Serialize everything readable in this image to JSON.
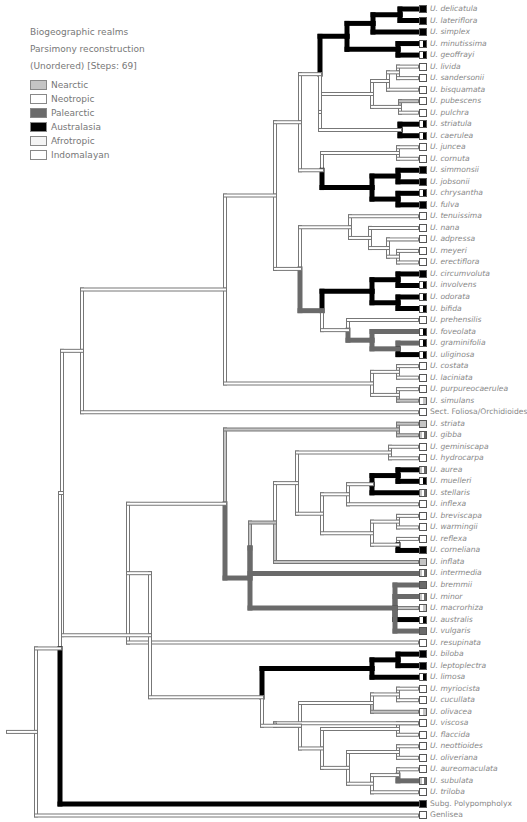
{
  "header": {
    "line1": "Biogeographic realms",
    "line2": "Parsimony reconstruction",
    "line3": "(Unordered) [Steps: 69]"
  },
  "legend": [
    {
      "label": "Nearctic",
      "color": "#c4c4c4"
    },
    {
      "label": "Neotropic",
      "color": "#ffffff"
    },
    {
      "label": "Palearctic",
      "color": "#6a6a6a"
    },
    {
      "label": "Australasia",
      "color": "#000000"
    },
    {
      "label": "Afrotropic",
      "color": "#f4f4f4"
    },
    {
      "label": "Indomalayan",
      "color": "#ffffff"
    }
  ],
  "colors": {
    "nearctic": "#c4c4c4",
    "neotropic": "#ffffff",
    "palearctic": "#6a6a6a",
    "australasia": "#000000",
    "outline": "#777777"
  },
  "taxa": [
    {
      "name": "U. delicatula",
      "state": "australasia"
    },
    {
      "name": "U. lateriflora",
      "state": "australasia"
    },
    {
      "name": "U. simplex",
      "state": "australasia"
    },
    {
      "name": "U. minutissima",
      "state": "mixed-aus"
    },
    {
      "name": "U. geoffrayi",
      "state": "mixed-aus"
    },
    {
      "name": "U. livida",
      "state": "neotropic"
    },
    {
      "name": "U. sandersonii",
      "state": "neotropic"
    },
    {
      "name": "U. bisquamata",
      "state": "neotropic"
    },
    {
      "name": "U. pubescens",
      "state": "neotropic"
    },
    {
      "name": "U. pulchra",
      "state": "neotropic"
    },
    {
      "name": "U. striatula",
      "state": "mixed-aus"
    },
    {
      "name": "U. caerulea",
      "state": "mixed-aus"
    },
    {
      "name": "U. juncea",
      "state": "neotropic"
    },
    {
      "name": "U. cornuta",
      "state": "neotropic"
    },
    {
      "name": "U. simmonsii",
      "state": "australasia"
    },
    {
      "name": "U. jobsonii",
      "state": "australasia"
    },
    {
      "name": "U. chrysantha",
      "state": "mixed-aus"
    },
    {
      "name": "U. fulva",
      "state": "australasia"
    },
    {
      "name": "U. tenuissima",
      "state": "neotropic"
    },
    {
      "name": "U. nana",
      "state": "neotropic"
    },
    {
      "name": "U. adpressa",
      "state": "neotropic"
    },
    {
      "name": "U. meyeri",
      "state": "neotropic"
    },
    {
      "name": "U. erectiflora",
      "state": "neotropic"
    },
    {
      "name": "U. circumvoluta",
      "state": "australasia"
    },
    {
      "name": "U. involvens",
      "state": "mixed-aus"
    },
    {
      "name": "U. odorata",
      "state": "mixed-aus"
    },
    {
      "name": "U. bifida",
      "state": "mixed-aus"
    },
    {
      "name": "U. prehensilis",
      "state": "neotropic"
    },
    {
      "name": "U. foveolata",
      "state": "mixed-aus"
    },
    {
      "name": "U. graminifolia",
      "state": "mixed-aus"
    },
    {
      "name": "U. uliginosa",
      "state": "mixed-aus"
    },
    {
      "name": "U. costata",
      "state": "neotropic"
    },
    {
      "name": "U. laciniata",
      "state": "neotropic"
    },
    {
      "name": "U. purpureocaerulea",
      "state": "neotropic"
    },
    {
      "name": "U. simulans",
      "state": "mixed-near"
    },
    {
      "name": "Sect. Foliosa/Orchidioides",
      "state": "neotropic"
    },
    {
      "name": "U. striata",
      "state": "nearctic"
    },
    {
      "name": "U. gibba",
      "state": "mixed-pal"
    },
    {
      "name": "U. geminiscapa",
      "state": "neotropic"
    },
    {
      "name": "U. hydrocarpa",
      "state": "neotropic"
    },
    {
      "name": "U. aurea",
      "state": "mixed-pal"
    },
    {
      "name": "U. muelleri",
      "state": "mixed-aus"
    },
    {
      "name": "U. stellaris",
      "state": "mixed-pal"
    },
    {
      "name": "U. inflexa",
      "state": "neotropic"
    },
    {
      "name": "U. breviscapa",
      "state": "neotropic"
    },
    {
      "name": "U. warmingii",
      "state": "neotropic"
    },
    {
      "name": "U. reflexa",
      "state": "neotropic"
    },
    {
      "name": "U. cornelianа",
      "state": "australasia"
    },
    {
      "name": "U. inflata",
      "state": "nearctic"
    },
    {
      "name": "U. intermedia",
      "state": "mixed-pal"
    },
    {
      "name": "U. bremmii",
      "state": "palearctic"
    },
    {
      "name": "U. minor",
      "state": "mixed-pal"
    },
    {
      "name": "U. macrorhiza",
      "state": "mixed-near"
    },
    {
      "name": "U. australis",
      "state": "mixed-aus"
    },
    {
      "name": "U. vulgaris",
      "state": "palearctic"
    },
    {
      "name": "U. resupinata",
      "state": "neotropic"
    },
    {
      "name": "U. biloba",
      "state": "australasia"
    },
    {
      "name": "U. leptoplectra",
      "state": "australasia"
    },
    {
      "name": "U. limosa",
      "state": "mixed-aus"
    },
    {
      "name": "U. myriocista",
      "state": "neotropic"
    },
    {
      "name": "U. cucullata",
      "state": "neotropic"
    },
    {
      "name": "U. olivacea",
      "state": "mixed-near"
    },
    {
      "name": "U. viscosa",
      "state": "neotropic"
    },
    {
      "name": "U. flaccida",
      "state": "neotropic"
    },
    {
      "name": "U. neottioides",
      "state": "neotropic"
    },
    {
      "name": "U. oliveriana",
      "state": "neotropic"
    },
    {
      "name": "U. aureomaculata",
      "state": "neotropic"
    },
    {
      "name": "U. subulata",
      "state": "mixed-pal"
    },
    {
      "name": "U. triloba",
      "state": "neotropic"
    },
    {
      "name": "Subg. Polypompholyx",
      "state": "australasia"
    },
    {
      "name": "Genlisea",
      "state": "neotropic"
    }
  ]
}
